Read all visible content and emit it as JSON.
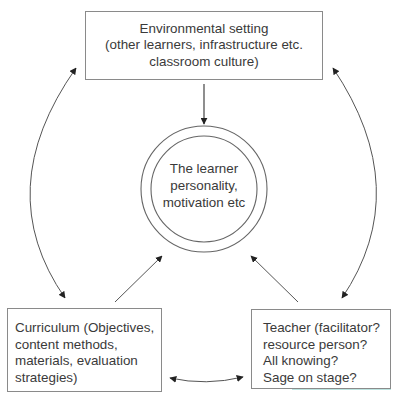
{
  "diagram": {
    "type": "concept-cycle",
    "nodes": {
      "environment": {
        "lines": [
          "Environmental setting",
          "(other learners, infrastructure etc.",
          "classroom culture)"
        ]
      },
      "learner": {
        "lines": [
          "The learner",
          "personality,",
          "motivation etc"
        ]
      },
      "curriculum": {
        "lines": [
          "Curriculum (Objectives,",
          "content methods,",
          "materials, evaluation",
          "strategies)"
        ]
      },
      "teacher": {
        "lines": [
          "Teacher (facilitator?",
          "resource person?",
          "All knowing?",
          "Sage on stage?"
        ]
      }
    },
    "edges": [
      {
        "from": "environment",
        "to": "learner",
        "direction": "one-way"
      },
      {
        "from": "curriculum",
        "to": "learner",
        "direction": "one-way"
      },
      {
        "from": "teacher",
        "to": "learner",
        "direction": "one-way"
      },
      {
        "from": "environment",
        "to": "curriculum",
        "direction": "two-way",
        "style": "curved"
      },
      {
        "from": "environment",
        "to": "teacher",
        "direction": "two-way",
        "style": "curved"
      },
      {
        "from": "curriculum",
        "to": "teacher",
        "direction": "two-way",
        "style": "curved"
      }
    ],
    "colors": {
      "line": "#555555",
      "box_border": "#8a8a8a",
      "text": "#3a3a3a"
    }
  }
}
